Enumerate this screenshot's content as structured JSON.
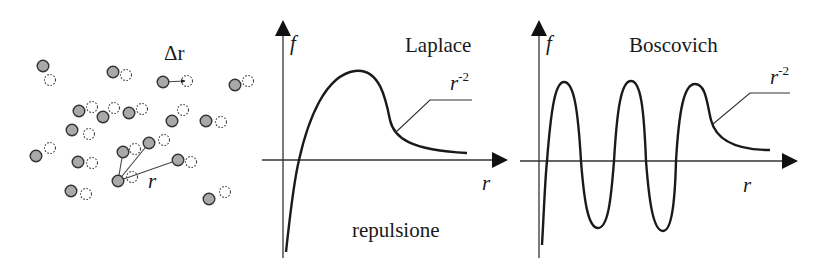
{
  "panels": {
    "particles": {
      "delta_label": "Δr",
      "r_label": "r",
      "solid_color": "#a9a9a9",
      "stroke_color": "#333333",
      "pairs": [
        {
          "solid": [
            43,
            66
          ],
          "ghost": [
            50,
            80
          ]
        },
        {
          "solid": [
            113,
            72
          ],
          "ghost": [
            126,
            75
          ]
        },
        {
          "solid": [
            163,
            82
          ],
          "ghost": [
            187,
            81
          ]
        },
        {
          "solid": [
            235,
            85
          ],
          "ghost": [
            248,
            81
          ]
        },
        {
          "solid": [
            79,
            111
          ],
          "ghost": [
            92,
            107
          ]
        },
        {
          "solid": [
            103,
            117
          ],
          "ghost": [
            114,
            108
          ]
        },
        {
          "solid": [
            129,
            113
          ],
          "ghost": [
            142,
            109
          ]
        },
        {
          "solid": [
            172,
            121
          ],
          "ghost": [
            183,
            110
          ]
        },
        {
          "solid": [
            206,
            121
          ],
          "ghost": [
            221,
            122
          ]
        },
        {
          "solid": [
            72,
            130
          ],
          "ghost": [
            89,
            134
          ]
        },
        {
          "solid": [
            36,
            156
          ],
          "ghost": [
            50,
            148
          ]
        },
        {
          "solid": [
            78,
            162
          ],
          "ghost": [
            92,
            163
          ]
        },
        {
          "solid": [
            123,
            152
          ],
          "ghost": [
            135,
            149
          ]
        },
        {
          "solid": [
            149,
            143
          ],
          "ghost": [
            164,
            140
          ]
        },
        {
          "solid": [
            178,
            160
          ],
          "ghost": [
            191,
            162
          ]
        },
        {
          "solid": [
            118,
            181
          ],
          "ghost": [
            132,
            177
          ]
        },
        {
          "solid": [
            71,
            191
          ],
          "ghost": [
            86,
            194
          ]
        },
        {
          "solid": [
            209,
            199
          ],
          "ghost": [
            225,
            192
          ]
        }
      ],
      "delta_arrow": {
        "from": [
          163,
          82
        ],
        "to": [
          185,
          81
        ]
      },
      "r_arrows": [
        {
          "from": [
            118,
            181
          ],
          "to": [
            123,
            152
          ]
        },
        {
          "from": [
            118,
            181
          ],
          "to": [
            149,
            143
          ]
        },
        {
          "from": [
            118,
            181
          ],
          "to": [
            178,
            160
          ]
        }
      ]
    },
    "laplace": {
      "title": "Laplace",
      "y_label": "f",
      "x_label": "r",
      "tail_label_base": "r",
      "tail_label_exp": "-2",
      "bottom_label": "repulsione"
    },
    "boscovich": {
      "title": "Boscovich",
      "y_label": "f",
      "x_label": "r",
      "tail_label_base": "r",
      "tail_label_exp": "-2"
    }
  },
  "colors": {
    "ink": "#1a1a1a",
    "axis": "#333333"
  }
}
